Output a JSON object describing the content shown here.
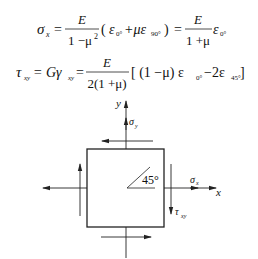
{
  "equations": {
    "eq1": {
      "lhs": "σ",
      "lhs_sub": "x",
      "eq": "=",
      "frac1_num": "E",
      "frac1_den": "1 −μ",
      "frac1_den_sup": "2",
      "paren_open": "(",
      "eps0": "ε",
      "eps0_sub": "0°",
      "plus": "+με",
      "eps90_sub": "90°",
      "paren_close": ")",
      "eq2": "=",
      "frac2_num": "E",
      "frac2_den": "1 +μ",
      "eps_end": "ε",
      "eps_end_sub": "0°"
    },
    "eq2": {
      "lhs": "τ",
      "lhs_sub": "xy",
      "mid": "= Gγ",
      "mid_sub": "xy",
      "eq": "=",
      "frac_num": "E",
      "frac_den": "2(1 +μ)",
      "bracket": "[ (1 −μ) ε",
      "eps0_sub": "0°",
      "minus": " −2ε",
      "eps45_sub": "45°",
      "bracket_close": " ]"
    }
  },
  "diagram": {
    "y_axis_label": "y",
    "x_axis_label": "x",
    "sigma_y": "σ",
    "sigma_y_sub": "y",
    "sigma_x": "σ",
    "sigma_x_sub": "x",
    "tau_xy": "τ",
    "tau_xy_sub": "xy",
    "angle_label": "45°"
  }
}
